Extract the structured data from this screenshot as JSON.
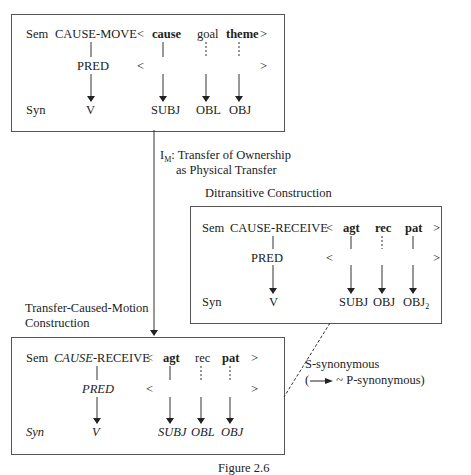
{
  "top_box": {
    "sem_label": "Sem",
    "predicate": "CAUSE-MOVE",
    "lt": "<",
    "gt": ">",
    "roles": [
      "cause",
      "goal",
      "theme"
    ],
    "pred_label": "PRED",
    "syn_label": "Syn",
    "syn": {
      "v": "V",
      "args": [
        "SUBJ",
        "OBL",
        "OBJ"
      ]
    }
  },
  "link": {
    "im_label": "I",
    "im_sub": "M",
    "im_text": ": Transfer of Ownership",
    "im_text2": "as Physical Transfer"
  },
  "ditransitive": {
    "title": "Ditransitive Construction",
    "sem_label": "Sem",
    "predicate": "CAUSE-RECEIVE",
    "lt": "<",
    "gt": ">",
    "roles": [
      "agt",
      "rec",
      "pat"
    ],
    "pred_label": "PRED",
    "syn_label": "Syn",
    "syn": {
      "v": "V",
      "args": [
        "SUBJ",
        "OBJ",
        "OBJ"
      ],
      "obj2_sub": "2"
    }
  },
  "tcm": {
    "title_line1": "Transfer-Caused-Motion",
    "title_line2": "Construction",
    "sem_label": "Sem",
    "predicate_italic": "CAUSE",
    "predicate_rest": "-RECEIVE",
    "lt": "<",
    "gt": ">",
    "roles": [
      "agt",
      "rec",
      "pat"
    ],
    "pred_label": "PRED",
    "syn_label": "Syn",
    "syn": {
      "v": "V",
      "args": [
        "SUBJ",
        "OBL",
        "OBJ"
      ]
    }
  },
  "relation": {
    "line1": "S-synonymous",
    "line2_open": "(",
    "line2_rest": " ~ P-synonymous)"
  },
  "caption": "Figure 2.6"
}
